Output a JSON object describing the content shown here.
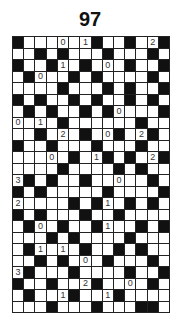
{
  "puzzle": {
    "title": "97",
    "columns": 14,
    "rows": 24,
    "legend": {
      "B": "black cell",
      ".": "white cell",
      "0-9": "numbered clue cell"
    },
    "colors": {
      "black": "#111111",
      "white": "#ffffff",
      "grid_line": "#222222",
      "text": "#222222"
    },
    "grid": [
      "B...0.1B..B.2B",
      "..B.B...B...B.",
      "B..B1.B.0.B..B",
      ".B0..B.B....B.",
      "....B...B.B..B",
      "B.B..B.B..B.B.",
      ".B.B..B.B0...B",
      "0.1.B......B..",
      "..B.2.B.0B.2B.",
      "B..B...B...B..",
      "...0.B.1B.B.2B",
      "....B....B.B..",
      "3B.B..B..0..B.",
      "B.B.....B....B",
      "2....B.B1.B.B.",
      "B.B...B..B....",
      ".B0.B..B1..B.B",
      "...B.B....B...",
      ".B1.1.B..B.B..",
      "..B.B.0.B...B.",
      "3B...B....B..B",
      "B..B..2B..0.B.",
      ".B..1B..1B....",
      "...B...B...BB."
    ]
  }
}
